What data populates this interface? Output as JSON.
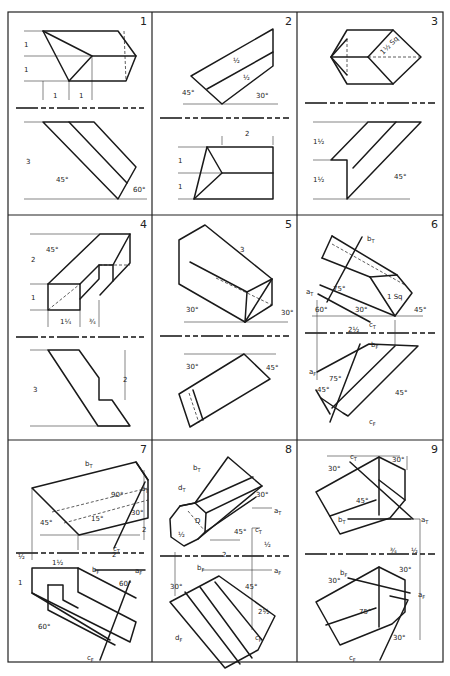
{
  "sheet": {
    "title": "Descriptive geometry exercises",
    "frame": {
      "x": 8,
      "y": 12,
      "width": 435,
      "height": 650
    },
    "columns": [
      8,
      152,
      297,
      443
    ],
    "rows": [
      12,
      215,
      440,
      662
    ],
    "line_color": "#1a1a1a",
    "background": "#ffffff"
  },
  "panels": [
    {
      "number": "1",
      "fold_line_y": 108,
      "objects": [
        "M43 31 L118 31 L136 56 L126 81 L69 81 Z",
        "M43 31 L92 56 L69 81",
        "M92 56 L136 56",
        "M43 122 L94 122 L136 167 L118 199 Z",
        "M69 122 L127 183"
      ],
      "hidden": [
        "M124 31 L126 81"
      ],
      "thin": [
        "M24 31 L43 31",
        "M24 56 L92 56",
        "M24 81 L69 81",
        "M43 81 L43 100",
        "M69 81 L69 100",
        "M92 56 L92 100",
        "M24 122 L43 122",
        "M24 199 L147 199"
      ],
      "labels": [
        {
          "text": "1",
          "x": 24,
          "y": 47
        },
        {
          "text": "1",
          "x": 24,
          "y": 72
        },
        {
          "text": "1",
          "x": 53,
          "y": 98
        },
        {
          "text": "1",
          "x": 79,
          "y": 98
        },
        {
          "text": "3",
          "x": 26,
          "y": 164
        },
        {
          "text": "45°",
          "x": 56,
          "y": 182
        },
        {
          "text": "60°",
          "x": 133,
          "y": 192
        }
      ]
    },
    {
      "number": "2",
      "fold_line_y": 118,
      "objects": [
        "M191 76 L273 29 L273 66 L222 104 Z",
        "M207 89 L273 52"
      ],
      "hidden": [],
      "thin": [
        "M183 104 L278 104",
        "M222 145 L222 136",
        "M273 145 L273 136",
        "M178 147 L207 147",
        "M178 173 L222 173",
        "M178 199 L194 199"
      ],
      "paths_front": [
        "M207 147 L273 147 L273 199 L194 199 Z",
        "M207 147 L222 173 L194 199",
        "M222 173 L273 173"
      ],
      "labels": [
        {
          "text": "2",
          "x": 245,
          "y": 136
        },
        {
          "text": "45°",
          "x": 182,
          "y": 95
        },
        {
          "text": "30°",
          "x": 256,
          "y": 98
        },
        {
          "text": "½",
          "x": 233,
          "y": 63
        },
        {
          "text": "½",
          "x": 243,
          "y": 80
        },
        {
          "text": "1",
          "x": 178,
          "y": 163
        },
        {
          "text": "1",
          "x": 178,
          "y": 189
        }
      ]
    },
    {
      "number": "3",
      "fold_line_y": 103,
      "objects": [
        "M347 30 L393 30 L421 57 L393 84 L347 84 L331 57 Z",
        "M347 39 L331 57 L347 75",
        "M368 57 L393 30",
        "M368 57 L393 84",
        "M331 57 L368 57",
        "M368 122 L421 122 L347 199 L347 160 L331 160 Z",
        "M396 122 L353 168"
      ],
      "hidden": [
        "M347 39 L347 75",
        "M368 57 L421 57"
      ],
      "thin": [
        "M313 122 L368 122",
        "M313 160 L331 160",
        "M313 199 L410 199"
      ],
      "labels": [
        {
          "text": "1½ Sq",
          "x": 383,
          "y": 55,
          "rotate": -45
        },
        {
          "text": "1½",
          "x": 313,
          "y": 144
        },
        {
          "text": "1½",
          "x": 313,
          "y": 182
        },
        {
          "text": "45°",
          "x": 394,
          "y": 179
        }
      ]
    },
    {
      "number": "4",
      "fold_line_y": 337,
      "objects": [
        "M48 284 L80 284 L80 310 L48 310 Z",
        "M48 284 L100 234 L130 234 L113 265 L99 265 L99 279 L80 299",
        "M80 284 L99 265",
        "M113 265 L113 281 L100 295",
        "M130 234 L130 263 L113 281",
        "M48 350 L79 350 L99 378 L99 400 L112 400 L130 426 L98 426 Z"
      ],
      "hidden": [
        "M48 310 L80 284",
        "M99 265 L130 265"
      ],
      "thin": [
        "M30 234 L100 234",
        "M30 284 L48 284",
        "M30 310 L48 310",
        "M48 310 L48 327",
        "M80 310 L80 327",
        "M99 300 L99 327",
        "M30 350 L48 350",
        "M30 426 L130 426",
        "M125 350 L125 400"
      ],
      "labels": [
        {
          "text": "2",
          "x": 31,
          "y": 262
        },
        {
          "text": "1",
          "x": 31,
          "y": 300
        },
        {
          "text": "45°",
          "x": 46,
          "y": 252
        },
        {
          "text": "1¼",
          "x": 60,
          "y": 324
        },
        {
          "text": "¾",
          "x": 89,
          "y": 324
        },
        {
          "text": "3",
          "x": 33,
          "y": 392
        },
        {
          "text": "2",
          "x": 123,
          "y": 382
        }
      ]
    },
    {
      "number": "5",
      "fold_line_y": 336,
      "objects": [
        "M179 240 L205 225 L272 279 L245 322 L179 284 Z",
        "M190 262 L247 292",
        "M247 292 L272 279",
        "M247 292 L245 322",
        "M272 279 L272 305 L245 322"
      ],
      "hidden": [
        "M216 278 L272 305"
      ],
      "thin": [
        "M184 322 L288 322",
        "M184 354 L276 354"
      ],
      "paths_front": [
        "M244 354 L270 379 L190 427 L179 394 Z",
        "M193 390 L203 420"
      ],
      "hidden_front": [
        "M189 393 L199 423"
      ],
      "labels": [
        {
          "text": "3",
          "x": 240,
          "y": 252
        },
        {
          "text": "30°",
          "x": 186,
          "y": 312
        },
        {
          "text": "30°",
          "x": 281,
          "y": 315
        },
        {
          "text": "30°",
          "x": 186,
          "y": 369
        },
        {
          "text": "45°",
          "x": 266,
          "y": 370
        }
      ]
    },
    {
      "number": "6",
      "fold_line_y": 333,
      "objects": [
        "M332 236 L397 275 L412 293 L395 316 L320 285",
        "M322 258 L370 277",
        "M370 277 L395 316",
        "M370 277 L397 275",
        "M362 237 L327 302",
        "M318 294 L370 322",
        "M332 236 L322 258"
      ],
      "hidden": [
        "M332 244 L405 285"
      ],
      "thin": [
        "M312 316 L423 316",
        "M317 300 L317 380",
        "M395 320 L395 345"
      ],
      "paths_front": [
        "M317 372 L369 344 L418 346 L348 416 L343 413 L321 398",
        "M360 344 L330 422",
        "M395 346 L332 408",
        "M316 390 L330 414"
      ],
      "labels": [
        {
          "text": "bT",
          "x": 367,
          "y": 241
        },
        {
          "text": "aT",
          "x": 306,
          "y": 294
        },
        {
          "text": "75°",
          "x": 333,
          "y": 291
        },
        {
          "text": "1 Sq",
          "x": 387,
          "y": 299
        },
        {
          "text": "60°",
          "x": 315,
          "y": 312
        },
        {
          "text": "30°",
          "x": 355,
          "y": 312
        },
        {
          "text": "45°",
          "x": 414,
          "y": 312
        },
        {
          "text": "cT",
          "x": 369,
          "y": 327
        },
        {
          "text": "2½",
          "x": 348,
          "y": 332
        },
        {
          "text": "bF",
          "x": 371,
          "y": 347
        },
        {
          "text": "aF",
          "x": 309,
          "y": 374
        },
        {
          "text": "75°",
          "x": 329,
          "y": 381
        },
        {
          "text": "45°",
          "x": 317,
          "y": 392
        },
        {
          "text": "45°",
          "x": 395,
          "y": 395
        },
        {
          "text": "cF",
          "x": 369,
          "y": 424
        }
      ]
    },
    {
      "number": "7",
      "fold_line_y": 553,
      "objects": [
        "M32 488 L136 462 L148 480 L148 518 L79 535 Z",
        "M136 462 L148 480",
        "M145 482 L114 548"
      ],
      "hidden": [
        "M52 512 L148 488",
        "M64 523 L148 500"
      ],
      "thin": [
        "M40 535 L140 535",
        "M32 488 L32 560",
        "M78 535 L78 550",
        "M144 470 L144 540"
      ],
      "paths_front": [
        "M32 568 L78 568 L78 592 L136 622 L130 642 L32 593 Z",
        "M48 585 L63 585 L63 600 L78 608",
        "M48 585 L48 610 L115 645",
        "M32 593 L110 640",
        "M78 568 L136 598",
        "M95 570 L145 570",
        "M130 581 L100 660"
      ],
      "labels": [
        {
          "text": "bT",
          "x": 85,
          "y": 466
        },
        {
          "text": "aT",
          "x": 141,
          "y": 491
        },
        {
          "text": "90°",
          "x": 111,
          "y": 497
        },
        {
          "text": "30°",
          "x": 131,
          "y": 515
        },
        {
          "text": "45°",
          "x": 40,
          "y": 525
        },
        {
          "text": "15°",
          "x": 91,
          "y": 521
        },
        {
          "text": "cT",
          "x": 113,
          "y": 551
        },
        {
          "text": "2",
          "x": 142,
          "y": 532
        },
        {
          "text": "1½",
          "x": 52,
          "y": 565
        },
        {
          "text": "2",
          "x": 112,
          "y": 557
        },
        {
          "text": "bF",
          "x": 92,
          "y": 572
        },
        {
          "text": "aF",
          "x": 135,
          "y": 573
        },
        {
          "text": "60°",
          "x": 119,
          "y": 586
        },
        {
          "text": "60°",
          "x": 38,
          "y": 629
        },
        {
          "text": "cF",
          "x": 87,
          "y": 660
        },
        {
          "text": "½",
          "x": 18,
          "y": 559
        },
        {
          "text": "1",
          "x": 18,
          "y": 585
        }
      ]
    },
    {
      "number": "8",
      "fold_line_y": 556,
      "objects": [
        "M228 457 L262 486 L198 539 L184 546 L171 537 L170 519 L180 506 L195 503 Z",
        "M180 506 L195 503 L206 513 L205 532 L198 539",
        "M195 503 L253 477",
        "M206 513 L262 486",
        "M205 532 L256 497"
      ],
      "hidden": [
        "M188 511 L204 530"
      ],
      "thin": [
        "M210 540 L240 540",
        "M252 508 L272 508",
        "M260 528 L252 528 L252 630",
        "M175 552 L175 596",
        "M202 570 L272 570"
      ],
      "paths_front": [
        "M219 576 L275 616 L258 650 L225 668 L170 602 Z",
        "M185 592 L240 664",
        "M200 587 L252 658",
        "M215 582 L262 640"
      ],
      "labels": [
        {
          "text": "bT",
          "x": 193,
          "y": 470
        },
        {
          "text": "dT",
          "x": 178,
          "y": 490
        },
        {
          "text": "30°",
          "x": 256,
          "y": 497
        },
        {
          "text": "aT",
          "x": 274,
          "y": 513
        },
        {
          "text": "½",
          "x": 178,
          "y": 537
        },
        {
          "text": "D",
          "x": 195,
          "y": 523
        },
        {
          "text": "45°",
          "x": 234,
          "y": 534
        },
        {
          "text": "cT",
          "x": 255,
          "y": 532
        },
        {
          "text": "½",
          "x": 264,
          "y": 547
        },
        {
          "text": "2",
          "x": 222,
          "y": 557
        },
        {
          "text": "bF",
          "x": 197,
          "y": 570
        },
        {
          "text": "aF",
          "x": 274,
          "y": 573
        },
        {
          "text": "30°",
          "x": 170,
          "y": 589
        },
        {
          "text": "45°",
          "x": 245,
          "y": 589
        },
        {
          "text": "2½",
          "x": 258,
          "y": 614
        },
        {
          "text": "dF",
          "x": 175,
          "y": 640
        },
        {
          "text": "cF",
          "x": 255,
          "y": 640
        }
      ]
    },
    {
      "number": "9",
      "fold_line_y": 554,
      "objects": [
        "M379 457 L405 470 L405 500 L390 518 L340 534 L316 492 Z",
        "M379 457 L379 515",
        "M379 480 L405 500",
        "M330 516 L376 500",
        "M348 519 L411 519",
        "M350 462 L413 519"
      ],
      "hidden": [],
      "thin": [
        "M327 456 L400 456",
        "M407 456 L407 470",
        "M380 519 L420 519",
        "M420 519 L420 640"
      ],
      "paths_front": [
        "M379 567 L405 580 L405 612 L392 624 L340 645 L316 602 Z",
        "M379 567 L379 627",
        "M326 625 L376 608",
        "M348 578 L410 593",
        "M390 596 L408 600 L380 660"
      ],
      "labels": [
        {
          "text": "cT",
          "x": 350,
          "y": 459
        },
        {
          "text": "30°",
          "x": 392,
          "y": 462
        },
        {
          "text": "30°",
          "x": 328,
          "y": 471
        },
        {
          "text": "45°",
          "x": 356,
          "y": 503
        },
        {
          "text": "bT",
          "x": 338,
          "y": 522
        },
        {
          "text": "aT",
          "x": 421,
          "y": 522
        },
        {
          "text": "¾",
          "x": 390,
          "y": 553
        },
        {
          "text": "½",
          "x": 411,
          "y": 553
        },
        {
          "text": "30°",
          "x": 399,
          "y": 572
        },
        {
          "text": "bF",
          "x": 340,
          "y": 575
        },
        {
          "text": "30°",
          "x": 328,
          "y": 583
        },
        {
          "text": "aF",
          "x": 418,
          "y": 597
        },
        {
          "text": "75°",
          "x": 359,
          "y": 614
        },
        {
          "text": "30°",
          "x": 393,
          "y": 640
        },
        {
          "text": "cF",
          "x": 349,
          "y": 660
        }
      ]
    }
  ]
}
